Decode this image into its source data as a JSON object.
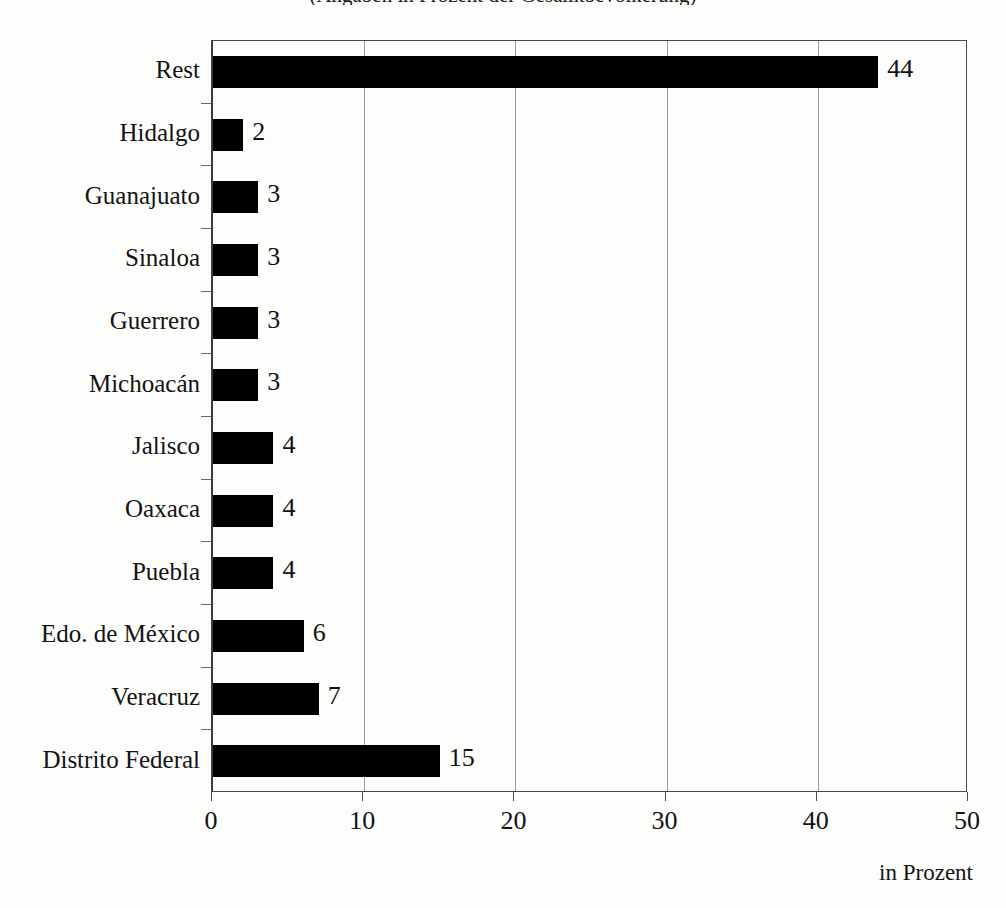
{
  "figure": {
    "title_remnant": "(Angaben in Prozent der Gesamtbevölkerung)",
    "axis_unit_label": "in Prozent",
    "background_color": "#fdfdfc",
    "bar_color": "#000000",
    "frame_color": "#4a4a4a",
    "gridline_color": "#9a9a9a"
  },
  "chart_data": {
    "type": "bar",
    "orientation": "horizontal",
    "title": "",
    "xlabel": "in Prozent",
    "ylabel": "",
    "xlim": [
      0,
      50
    ],
    "xticks": [
      0,
      10,
      20,
      30,
      40,
      50
    ],
    "xtick_labels": [
      "0",
      "10",
      "20",
      "30",
      "40",
      "50"
    ],
    "grid": "vertical",
    "legend": "none",
    "categories": [
      "Rest",
      "Hidalgo",
      "Guanajuato",
      "Sinaloa",
      "Guerrero",
      "Michoacán",
      "Jalisco",
      "Oaxaca",
      "Puebla",
      "Edo. de México",
      "Veracruz",
      "Distrito Federal"
    ],
    "values": [
      44,
      2,
      3,
      3,
      3,
      3,
      4,
      4,
      4,
      6,
      7,
      15
    ],
    "value_labels": [
      "44",
      "2",
      "3",
      "3",
      "3",
      "3",
      "4",
      "4",
      "4",
      "6",
      "7",
      "15"
    ]
  }
}
